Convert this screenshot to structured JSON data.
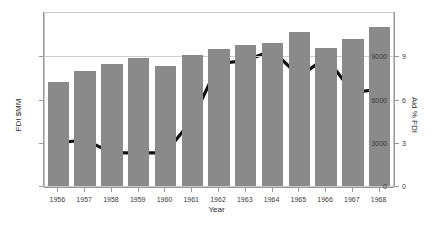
{
  "chart_data": {
    "type": "bar",
    "title": "",
    "subtitle": "",
    "xlabel": "Year",
    "ylabel": "FDI $MM",
    "y2label": "Aid % FDI",
    "categories": [
      "1956",
      "1957",
      "1958",
      "1959",
      "1960",
      "1961",
      "1962",
      "1963",
      "1964",
      "1965",
      "1966",
      "1967",
      "1968"
    ],
    "ylim": [
      0,
      12000
    ],
    "y2lim": [
      0,
      12
    ],
    "yticks": [
      0,
      3000,
      6000,
      9000
    ],
    "yticklabels": [
      "0",
      "3000",
      "6000",
      "9000"
    ],
    "y2ticks": [
      0,
      3,
      6,
      9
    ],
    "y2ticklabels": [
      "0",
      "3",
      "6",
      "9"
    ],
    "grid": "horizontal-at-9000-only",
    "legend": "none",
    "series": [
      {
        "name": "FDI $MM",
        "type": "bar",
        "axis": "left",
        "color": "#8a8a8a",
        "values": [
          7200,
          7950,
          8450,
          8900,
          8300,
          9100,
          9500,
          9800,
          9950,
          10700,
          9600,
          10200,
          11000
        ]
      },
      {
        "name": "Aid % FDI",
        "type": "line",
        "axis": "right",
        "color": "#111111",
        "values": [
          3.0,
          3.2,
          2.3,
          2.3,
          2.3,
          4.6,
          8.5,
          8.7,
          9.4,
          7.6,
          8.9,
          6.5,
          6.7
        ]
      }
    ]
  },
  "axes": {
    "left_title": "FDI $MM",
    "right_title": "Aid % FDI",
    "bottom_title": "Year"
  },
  "colors": {
    "bar_fill": "#8a8a8a",
    "line_stroke": "#111111",
    "grid": "#cfcfcf",
    "axis": "#999999",
    "frame": "#c9c9c9",
    "background": "#ffffff",
    "text": "#3a3a3a"
  }
}
